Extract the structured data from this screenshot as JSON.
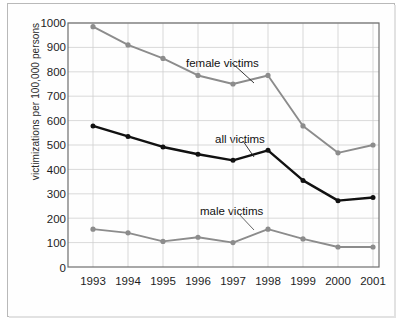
{
  "chart_data": {
    "type": "line",
    "title": "",
    "xlabel": "",
    "ylabel": "victimizations per 100,000 persons",
    "categories": [
      "1993",
      "1994",
      "1995",
      "1996",
      "1997",
      "1998",
      "1999",
      "2000",
      "2001"
    ],
    "x": [
      1993,
      1994,
      1995,
      1996,
      1997,
      1998,
      1999,
      2000,
      2001
    ],
    "ylim": [
      0,
      1000
    ],
    "yticks": [
      0,
      100,
      200,
      300,
      400,
      500,
      600,
      700,
      800,
      900,
      1000
    ],
    "ytick_labels": [
      "0",
      "100",
      "200",
      "300",
      "400",
      "500",
      "600",
      "700",
      "800",
      "900",
      "1000"
    ],
    "grid": true,
    "legend_position": "inline-annotations",
    "series": [
      {
        "name": "female victims",
        "color": "#8c8c8c",
        "values": [
          985,
          910,
          855,
          785,
          750,
          785,
          578,
          468,
          500
        ]
      },
      {
        "name": "all victims",
        "color": "#111111",
        "values": [
          578,
          535,
          492,
          462,
          437,
          478,
          355,
          272,
          285
        ]
      },
      {
        "name": "male victims",
        "color": "#8c8c8c",
        "values": [
          155,
          140,
          105,
          122,
          100,
          155,
          115,
          82,
          82
        ]
      }
    ],
    "annotations": [
      {
        "text": "female victims",
        "series": "female victims",
        "points_to_year": "1998"
      },
      {
        "text": "all victims",
        "series": "all victims",
        "points_to_year": "1998"
      },
      {
        "text": "male victims",
        "series": "male victims",
        "points_to_year": "1998"
      }
    ]
  },
  "colors": {
    "female_line": "#8c8c8c",
    "all_line": "#111111",
    "male_line": "#8c8c8c",
    "grid": "#cfcfcf",
    "axis": "#6e6e6e",
    "frame": "#b9b9b9",
    "background": "#ffffff"
  }
}
